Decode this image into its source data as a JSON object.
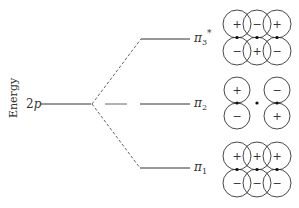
{
  "diagram": {
    "axis_label": "Energy",
    "atomic_level": {
      "label": "2p",
      "italic_part": "p",
      "prefix": "2"
    },
    "levels": [
      {
        "id": "pi3",
        "label_base": "π",
        "subscript": "3",
        "superscript": "*",
        "y": 39,
        "lobes_top": [
          "+",
          "−",
          "+"
        ],
        "lobes_bottom": [
          "−",
          "+",
          "−"
        ]
      },
      {
        "id": "pi2",
        "label_base": "π",
        "subscript": "2",
        "superscript": "",
        "y": 104,
        "lobes_top": [
          "+",
          "",
          "−"
        ],
        "lobes_bottom": [
          "−",
          "",
          "+"
        ]
      },
      {
        "id": "pi1",
        "label_base": "π",
        "subscript": "1",
        "superscript": "",
        "y": 168,
        "lobes_top": [
          "+",
          "+",
          "+"
        ],
        "lobes_bottom": [
          "−",
          "−",
          "−"
        ]
      }
    ],
    "colors": {
      "line": "#333333",
      "dashed": "#555555"
    }
  }
}
